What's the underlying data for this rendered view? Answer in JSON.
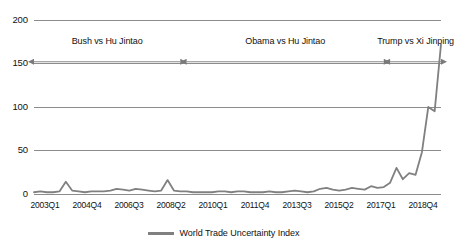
{
  "chart_data": {
    "type": "line",
    "title": "",
    "xlabel": "",
    "ylabel": "",
    "ylim": [
      0,
      200
    ],
    "yticks": [
      0,
      50,
      100,
      150,
      200
    ],
    "grid": true,
    "legend_position": "bottom",
    "legend": [
      {
        "name": "World Trade Uncertainty Index",
        "color": "#808080"
      }
    ],
    "xtick_labels": [
      "2003Q1",
      "2004Q4",
      "2006Q3",
      "2008Q2",
      "2010Q1",
      "2011Q4",
      "2013Q3",
      "2015Q2",
      "2017Q1",
      "2018Q4"
    ],
    "series": [
      {
        "name": "World Trade Uncertainty Index",
        "color": "#808080",
        "x": [
          "2003Q1",
          "2003Q2",
          "2003Q3",
          "2003Q4",
          "2004Q1",
          "2004Q2",
          "2004Q3",
          "2004Q4",
          "2005Q1",
          "2005Q2",
          "2005Q3",
          "2005Q4",
          "2006Q1",
          "2006Q2",
          "2006Q3",
          "2006Q4",
          "2007Q1",
          "2007Q2",
          "2007Q3",
          "2007Q4",
          "2008Q1",
          "2008Q2",
          "2008Q3",
          "2008Q4",
          "2009Q1",
          "2009Q2",
          "2009Q3",
          "2009Q4",
          "2010Q1",
          "2010Q2",
          "2010Q3",
          "2010Q4",
          "2011Q1",
          "2011Q2",
          "2011Q3",
          "2011Q4",
          "2012Q1",
          "2012Q2",
          "2012Q3",
          "2012Q4",
          "2013Q1",
          "2013Q2",
          "2013Q3",
          "2013Q4",
          "2014Q1",
          "2014Q2",
          "2014Q3",
          "2014Q4",
          "2015Q1",
          "2015Q2",
          "2015Q3",
          "2015Q4",
          "2016Q1",
          "2016Q2",
          "2016Q3",
          "2016Q4",
          "2017Q1",
          "2017Q2",
          "2017Q3",
          "2017Q4",
          "2018Q1",
          "2018Q2",
          "2018Q3",
          "2018Q4",
          "2019Q1"
        ],
        "values": [
          2,
          3,
          2,
          2,
          3,
          14,
          4,
          3,
          2,
          3,
          3,
          3,
          4,
          6,
          5,
          4,
          6,
          5,
          4,
          3,
          4,
          16,
          4,
          3,
          3,
          2,
          2,
          2,
          2,
          3,
          3,
          2,
          3,
          3,
          2,
          2,
          2,
          3,
          2,
          2,
          3,
          4,
          3,
          2,
          3,
          6,
          7,
          5,
          4,
          5,
          7,
          6,
          5,
          9,
          7,
          8,
          13,
          30,
          17,
          24,
          22,
          48,
          100,
          95,
          172
        ]
      }
    ],
    "annotations": [
      {
        "label": "Bush vs Hu Jintao",
        "start": "2003Q1",
        "end": "2008Q4",
        "y": 152
      },
      {
        "label": "Obama vs Hu Jintao",
        "start": "2009Q1",
        "end": "2016Q4",
        "y": 152
      },
      {
        "label": "Trump vs Xi Jinping",
        "start": "2017Q1",
        "end": "2019Q1",
        "y": 152
      }
    ]
  },
  "legend": {
    "label": "World Trade Uncertainty Index"
  }
}
